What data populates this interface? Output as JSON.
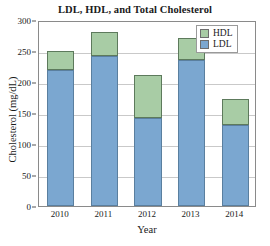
{
  "chart_data": {
    "type": "bar",
    "subtype": "stacked-vertical",
    "title": "LDL, HDL, and Total Cholesterol",
    "xlabel": "Year",
    "ylabel": "Cholesterol (mg/dL)",
    "categories": [
      "2010",
      "2011",
      "2012",
      "2013",
      "2014"
    ],
    "series": [
      {
        "name": "LDL",
        "color": "#7ba7d0",
        "values": [
          220,
          242,
          142,
          236,
          131
        ]
      },
      {
        "name": "HDL",
        "color": "#a8cca5",
        "values": [
          30,
          39,
          69,
          35,
          41
        ]
      }
    ],
    "totals": [
      250,
      281,
      211,
      271,
      172
    ],
    "ylim": [
      0,
      300
    ],
    "yticks": [
      0,
      50,
      100,
      150,
      200,
      250,
      300
    ],
    "ytick_labels": [
      "0",
      "50",
      "100",
      "150",
      "200",
      "250",
      "300"
    ],
    "grid": "horizontal",
    "legend_position": "top-right",
    "legend_order": [
      "HDL",
      "LDL"
    ],
    "stack_order_bottom_to_top": [
      "LDL",
      "HDL"
    ]
  },
  "legend": {
    "entries": [
      {
        "label": "HDL",
        "color": "#a8cca5"
      },
      {
        "label": "LDL",
        "color": "#7ba7d0"
      }
    ]
  },
  "colors": {
    "ldl": "#7ba7d0",
    "hdl": "#a8cca5",
    "grid": "#c9c9c9",
    "axis": "#8a8a8a",
    "text": "#1a1a1a",
    "background": "#ffffff"
  }
}
